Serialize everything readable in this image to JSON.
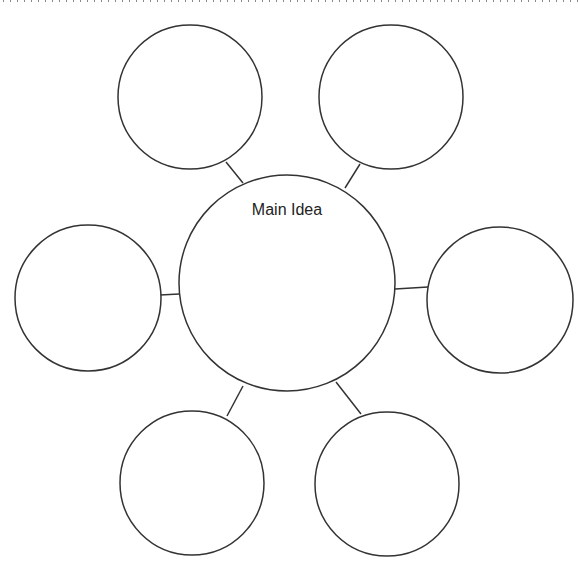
{
  "diagram": {
    "type": "bubble-map",
    "stroke_color": "#333333",
    "main": {
      "label": "Main Idea",
      "cx": 287,
      "cy": 283,
      "r": 108
    },
    "satellites": [
      {
        "name": "top-left",
        "cx": 190,
        "cy": 97,
        "r": 72,
        "label": ""
      },
      {
        "name": "top-right",
        "cx": 391,
        "cy": 97,
        "r": 72,
        "label": ""
      },
      {
        "name": "left",
        "cx": 88,
        "cy": 298,
        "r": 73,
        "label": ""
      },
      {
        "name": "right",
        "cx": 500,
        "cy": 300,
        "r": 73,
        "label": ""
      },
      {
        "name": "bottom-left",
        "cx": 192,
        "cy": 483,
        "r": 72,
        "label": ""
      },
      {
        "name": "bottom-right",
        "cx": 387,
        "cy": 484,
        "r": 72,
        "label": ""
      }
    ]
  }
}
